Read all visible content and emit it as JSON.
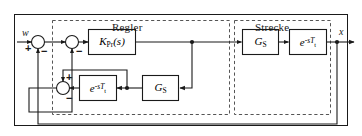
{
  "diagram": {
    "title_regler": "Regler",
    "title_strecke": "Strecke",
    "signals": {
      "reference": "w",
      "output": "x"
    },
    "signs": {
      "sum1_plus": "+",
      "sum1_minus": "−",
      "sum2_minus": "−",
      "sum3_plus": "+",
      "sum3_minus": "−"
    },
    "blocks": {
      "controller": {
        "name": "K_Pr(s)",
        "base": "K",
        "subscript": "Pr",
        "tail": "(s)"
      },
      "plant_gs": {
        "name": "G_S",
        "base": "G",
        "subscript": "S"
      },
      "plant_delay": {
        "name": "e^-sTt",
        "base": "e",
        "exponent": "-sT",
        "exponent_subscript": "t"
      },
      "model_delay": {
        "name": "e^-sTt",
        "base": "e",
        "exponent": "-sT",
        "exponent_subscript": "t"
      },
      "model_gs": {
        "name": "G_S",
        "base": "G",
        "subscript": "S"
      }
    },
    "colors": {
      "line": "#1a1a1a",
      "dashed": "#555555",
      "background": "#ffffff"
    }
  }
}
